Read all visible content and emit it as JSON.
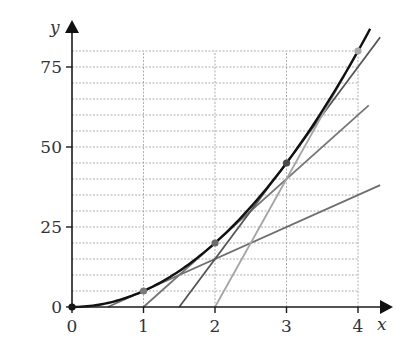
{
  "chart_data": {
    "type": "line",
    "title": "",
    "xlabel": "x",
    "ylabel": "y",
    "xlim": [
      0,
      4
    ],
    "ylim": [
      0,
      80
    ],
    "x_ticks": [
      0,
      1,
      2,
      3,
      4
    ],
    "x_tick_labels": [
      "0",
      "1",
      "2",
      "3",
      "4"
    ],
    "y_ticks": [
      0,
      25,
      50,
      75
    ],
    "y_tick_labels": [
      "0",
      "25",
      "50",
      "75"
    ],
    "grid": {
      "on": true,
      "x_step": 1,
      "y_step": 5,
      "style": "dashed"
    },
    "curve": {
      "name": "y = 5x^2",
      "function": "5*x^2",
      "x_range": [
        0,
        4.17
      ],
      "color": "#111111"
    },
    "points": [
      {
        "x": 0,
        "y": 0,
        "color": "#111111"
      },
      {
        "x": 1,
        "y": 5,
        "color": "#7a7a7a"
      },
      {
        "x": 2,
        "y": 20,
        "color": "#6a6a6a"
      },
      {
        "x": 3,
        "y": 45,
        "color": "#4a4a4a"
      },
      {
        "x": 4,
        "y": 80,
        "color": "#a8a8a8"
      }
    ],
    "tangent_lines": [
      {
        "at_x": 1,
        "slope": 10,
        "x_intercept": 0.5,
        "x_range": [
          0.5,
          4.31
        ],
        "color": "#6e6e6e"
      },
      {
        "at_x": 2,
        "slope": 20,
        "x_intercept": 1,
        "x_range": [
          1,
          4.15
        ],
        "color": "#777777"
      },
      {
        "at_x": 3,
        "slope": 30,
        "x_intercept": 1.5,
        "x_range": [
          1.5,
          4.31
        ],
        "color": "#555555"
      },
      {
        "at_x": 4,
        "slope": 40,
        "x_intercept": 2,
        "x_range": [
          2,
          4
        ],
        "color": "#a5a5a5"
      }
    ]
  }
}
